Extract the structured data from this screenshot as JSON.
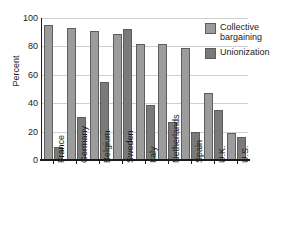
{
  "chart_data": {
    "type": "bar",
    "title": "",
    "xlabel": "",
    "ylabel": "Percent",
    "ylim": [
      0,
      100
    ],
    "yticks": [
      0,
      20,
      40,
      60,
      80,
      100
    ],
    "grid": true,
    "legend_position": "top-right",
    "categories": [
      "France",
      "Germany",
      "Belgium",
      "Sweden",
      "Italy",
      "Netherlands",
      "Spain",
      "U.K.",
      "U.S."
    ],
    "series": [
      {
        "name": "Collective bargaining",
        "color": "#9c9c9c",
        "values": [
          95,
          93,
          91,
          89,
          82,
          82,
          79,
          47,
          19
        ]
      },
      {
        "name": "Unionization",
        "color": "#7a7a7a",
        "values": [
          9,
          30,
          55,
          92,
          39,
          27,
          20,
          35,
          16
        ]
      }
    ]
  },
  "axis": {
    "y_title": "Percent",
    "y_tick_labels": [
      "100",
      "80",
      "60",
      "40",
      "20",
      "0"
    ]
  },
  "legend": {
    "items": [
      {
        "label": "Collective bargaining",
        "swatch": "collective-bargaining-swatch"
      },
      {
        "label": "Unionization",
        "swatch": "unionization-swatch"
      }
    ]
  }
}
